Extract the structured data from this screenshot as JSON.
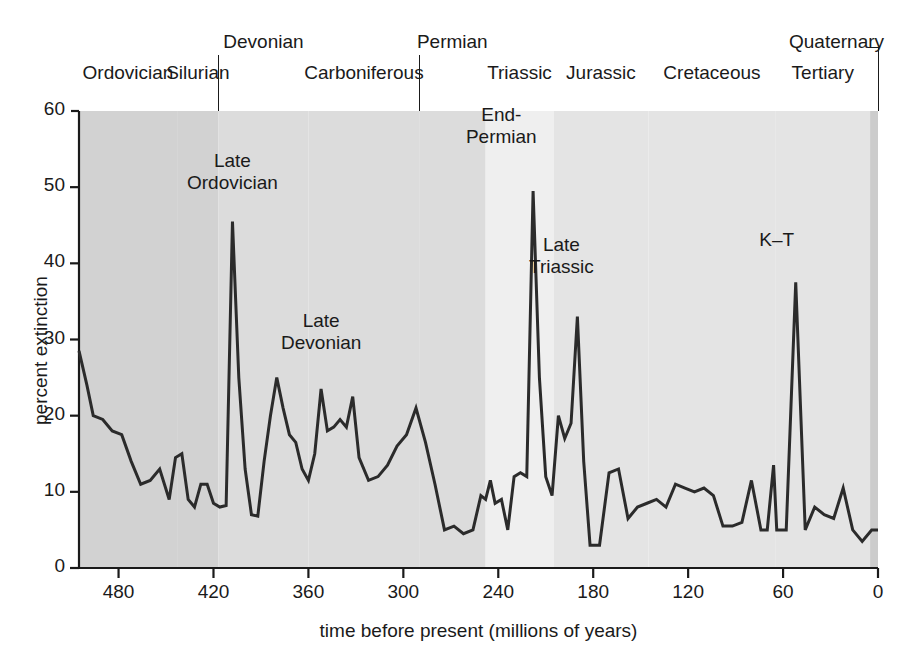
{
  "chart_data": {
    "type": "line",
    "title": "",
    "xlabel": "time before present (millions of years)",
    "ylabel": "percent extinction",
    "xlim": [
      505,
      0
    ],
    "ylim": [
      0,
      60
    ],
    "x_ticks": [
      480,
      420,
      360,
      300,
      240,
      180,
      120,
      60,
      0
    ],
    "y_ticks": [
      0,
      10,
      20,
      30,
      40,
      50,
      60
    ],
    "x_reversed": true,
    "grid": false,
    "legend": null,
    "line_color": "#2b2b2b",
    "series": [
      {
        "name": "percent extinction",
        "x": [
          505,
          500,
          496,
          490,
          484,
          478,
          472,
          466,
          460,
          454,
          448,
          444,
          440,
          436,
          432,
          428,
          424,
          420,
          416,
          412,
          408,
          404,
          400,
          396,
          392,
          388,
          384,
          380,
          376,
          372,
          368,
          364,
          360,
          356,
          352,
          348,
          344,
          340,
          336,
          332,
          328,
          322,
          316,
          310,
          304,
          298,
          292,
          286,
          280,
          274,
          268,
          262,
          256,
          251,
          248,
          245,
          242,
          238,
          234,
          230,
          226,
          222,
          218,
          214,
          210,
          206,
          202,
          198,
          194,
          190,
          186,
          182,
          176,
          170,
          164,
          158,
          152,
          146,
          140,
          134,
          128,
          122,
          116,
          110,
          104,
          98,
          92,
          86,
          80,
          74,
          70,
          66,
          64,
          62,
          58,
          52,
          46,
          40,
          34,
          28,
          22,
          16,
          10,
          4,
          0
        ],
        "y": [
          28.5,
          24.0,
          20.0,
          19.5,
          18.0,
          17.5,
          14.0,
          11.0,
          11.5,
          13.0,
          9.0,
          14.5,
          15.0,
          9.0,
          8.0,
          11.0,
          11.0,
          8.5,
          8.0,
          8.2,
          45.5,
          25.0,
          13.0,
          7.0,
          6.8,
          14.0,
          20.0,
          25.0,
          21.0,
          17.5,
          16.5,
          13.0,
          11.5,
          15.0,
          23.5,
          18.0,
          18.5,
          19.5,
          18.5,
          22.5,
          14.5,
          11.5,
          12.0,
          13.5,
          16.0,
          17.5,
          21.0,
          16.5,
          11.0,
          5.0,
          5.5,
          4.5,
          5.0,
          9.5,
          9.0,
          11.5,
          8.5,
          9.0,
          5.0,
          12.0,
          12.5,
          12.0,
          49.5,
          25.0,
          12.0,
          9.5,
          20.0,
          17.0,
          19.0,
          33.0,
          14.0,
          3.0,
          3.0,
          12.5,
          13.0,
          6.5,
          8.0,
          8.5,
          9.0,
          8.0,
          11.0,
          10.5,
          10.0,
          10.5,
          9.5,
          5.5,
          5.5,
          6.0,
          11.5,
          5.0,
          5.0,
          13.5,
          5.0,
          5.0,
          5.0,
          37.5,
          5.0,
          8.0,
          7.0,
          6.5,
          10.5,
          5.0,
          3.5,
          5.0,
          5.0
        ]
      }
    ],
    "annotations": [
      {
        "text": "Late\nOrdovician",
        "label_x": 408,
        "label_y": 52,
        "peak_x": 408,
        "peak_y": 45.5
      },
      {
        "text": "Late\nDevonian",
        "label_x": 352,
        "label_y": 31,
        "peak_x": 352,
        "peak_y": 23.5
      },
      {
        "text": "End-\nPermian",
        "label_x": 238,
        "label_y": 58,
        "peak_x": 218,
        "peak_y": 49.5
      },
      {
        "text": "Late\nTriassic",
        "label_x": 200,
        "label_y": 41,
        "peak_x": 190,
        "peak_y": 33.0
      },
      {
        "text": "K–T",
        "label_x": 64,
        "label_y": 43,
        "peak_x": 64,
        "peak_y": 37.5
      }
    ],
    "periods": [
      {
        "name": "Ordovician",
        "row": "bottom",
        "start": 505,
        "end": 443,
        "band_shade": "#d2d2d2"
      },
      {
        "name": "Silurian",
        "row": "bottom",
        "start": 443,
        "end": 417,
        "band_shade": "#d2d2d2"
      },
      {
        "name": "Devonian",
        "row": "top",
        "start": 417,
        "end": 360,
        "band_shade": "#dcdcdc"
      },
      {
        "name": "Carboniferous",
        "row": "bottom",
        "start": 360,
        "end": 290,
        "band_shade": "#dcdcdc"
      },
      {
        "name": "Permian",
        "row": "top",
        "start": 290,
        "end": 248,
        "band_shade": "#dcdcdc"
      },
      {
        "name": "Triassic",
        "row": "bottom",
        "start": 248,
        "end": 205,
        "band_shade": "#efefef"
      },
      {
        "name": "Jurassic",
        "row": "bottom",
        "start": 205,
        "end": 145,
        "band_shade": "#e4e4e4"
      },
      {
        "name": "Cretaceous",
        "row": "bottom",
        "start": 145,
        "end": 65,
        "band_shade": "#e4e4e4"
      },
      {
        "name": "Tertiary",
        "row": "bottom",
        "start": 65,
        "end": 5,
        "band_shade": "#e4e4e4"
      },
      {
        "name": "Quaternary",
        "row": "top",
        "start": 5,
        "end": 0,
        "band_shade": "#cccccc"
      }
    ]
  },
  "axis": {
    "y_label": "percent extinction",
    "x_label": "time before present (millions of years)",
    "y_ticks": [
      "60",
      "50",
      "40",
      "30",
      "20",
      "10",
      "0"
    ],
    "x_ticks": [
      "480",
      "420",
      "360",
      "300",
      "240",
      "180",
      "120",
      "60",
      "0"
    ]
  },
  "period_rows": {
    "top": [
      "Devonian",
      "Permian",
      "Quaternary"
    ],
    "bottom": [
      "Ordovician",
      "Silurian",
      "Carboniferous",
      "Triassic",
      "Jurassic",
      "Cretaceous",
      "Tertiary"
    ]
  },
  "annotation_labels": {
    "late_ordovician_line1": "Late",
    "late_ordovician_line2": "Ordovician",
    "late_devonian_line1": "Late",
    "late_devonian_line2": "Devonian",
    "end_permian_line1": "End-",
    "end_permian_line2": "Permian",
    "late_triassic_line1": "Late",
    "late_triassic_line2": "Triassic",
    "kt": "K–T"
  },
  "colors": {
    "line": "#2b2b2b",
    "axis": "#1a1a1a",
    "background": "#ffffff"
  }
}
